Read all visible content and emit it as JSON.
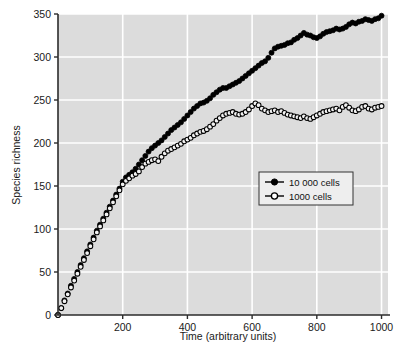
{
  "chart_data": {
    "type": "scatter",
    "title": "",
    "xlabel": "Time (arbitrary units)",
    "ylabel": "Species richness",
    "xlim": [
      0,
      1020
    ],
    "ylim": [
      0,
      350
    ],
    "xticks": [
      200,
      400,
      600,
      800,
      1000
    ],
    "yticks": [
      0,
      50,
      100,
      150,
      200,
      250,
      300,
      350
    ],
    "xtick_labels": [
      "200",
      "400",
      "600",
      "800",
      "1000"
    ],
    "ytick_labels": [
      "0",
      "50",
      "100",
      "150",
      "200",
      "250",
      "300",
      "350"
    ],
    "grid": true,
    "grid_color": "#ffffff",
    "plot_background": "#dcdcdc",
    "legend_position": "center-right",
    "marker_color": "#000000",
    "series": [
      {
        "name": "10 000 cells",
        "marker": "filled-circle",
        "x": [
          0,
          10,
          20,
          30,
          40,
          50,
          60,
          70,
          80,
          90,
          100,
          110,
          120,
          130,
          140,
          150,
          160,
          170,
          180,
          190,
          200,
          210,
          220,
          230,
          240,
          250,
          260,
          270,
          280,
          290,
          300,
          310,
          320,
          330,
          340,
          350,
          360,
          370,
          380,
          390,
          400,
          410,
          420,
          430,
          440,
          450,
          460,
          470,
          480,
          490,
          500,
          510,
          520,
          530,
          540,
          550,
          560,
          570,
          580,
          590,
          600,
          610,
          620,
          630,
          640,
          650,
          660,
          670,
          680,
          690,
          700,
          710,
          720,
          730,
          740,
          750,
          760,
          770,
          780,
          790,
          800,
          810,
          820,
          830,
          840,
          850,
          860,
          870,
          880,
          890,
          900,
          910,
          920,
          930,
          940,
          950,
          960,
          970,
          980,
          990,
          1000
        ],
        "y": [
          0,
          8,
          17,
          25,
          34,
          42,
          50,
          58,
          66,
          74,
          82,
          90,
          98,
          105,
          112,
          119,
          126,
          133,
          140,
          147,
          155,
          160,
          163,
          166,
          170,
          175,
          180,
          185,
          190,
          194,
          197,
          200,
          203,
          207,
          211,
          215,
          218,
          221,
          224,
          228,
          232,
          236,
          240,
          243,
          246,
          247,
          249,
          252,
          256,
          259,
          262,
          264,
          264,
          266,
          268,
          270,
          272,
          275,
          278,
          281,
          284,
          287,
          290,
          293,
          295,
          299,
          305,
          310,
          312,
          313,
          314,
          316,
          317,
          320,
          322,
          325,
          328,
          326,
          325,
          323,
          322,
          324,
          327,
          329,
          330,
          331,
          333,
          332,
          333,
          335,
          338,
          340,
          339,
          341,
          342,
          344,
          343,
          342,
          344,
          345,
          348
        ]
      },
      {
        "name": "1000 cells",
        "marker": "open-circle",
        "x": [
          0,
          10,
          20,
          30,
          40,
          50,
          60,
          70,
          80,
          90,
          100,
          110,
          120,
          130,
          140,
          150,
          160,
          170,
          180,
          190,
          200,
          210,
          220,
          230,
          240,
          250,
          260,
          270,
          280,
          290,
          300,
          310,
          320,
          330,
          340,
          350,
          360,
          370,
          380,
          390,
          400,
          410,
          420,
          430,
          440,
          450,
          460,
          470,
          480,
          490,
          500,
          510,
          520,
          530,
          540,
          550,
          560,
          570,
          580,
          590,
          600,
          610,
          620,
          630,
          640,
          650,
          660,
          670,
          680,
          690,
          700,
          710,
          720,
          730,
          740,
          750,
          760,
          770,
          780,
          790,
          800,
          810,
          820,
          830,
          840,
          850,
          860,
          870,
          880,
          890,
          900,
          910,
          920,
          930,
          940,
          950,
          960,
          970,
          980,
          990,
          1000
        ],
        "y": [
          0,
          8,
          16,
          24,
          32,
          40,
          48,
          56,
          64,
          72,
          80,
          88,
          96,
          103,
          110,
          117,
          124,
          131,
          138,
          145,
          152,
          156,
          159,
          162,
          164,
          167,
          172,
          176,
          178,
          180,
          181,
          179,
          184,
          188,
          191,
          193,
          195,
          197,
          199,
          202,
          204,
          206,
          209,
          211,
          213,
          214,
          216,
          219,
          222,
          226,
          229,
          232,
          234,
          235,
          236,
          234,
          233,
          234,
          236,
          239,
          243,
          246,
          244,
          240,
          238,
          236,
          237,
          238,
          236,
          237,
          235,
          233,
          232,
          231,
          230,
          229,
          231,
          229,
          228,
          230,
          232,
          234,
          236,
          237,
          238,
          239,
          240,
          238,
          242,
          244,
          241,
          238,
          237,
          239,
          242,
          243,
          240,
          239,
          241,
          242,
          243
        ]
      }
    ]
  },
  "legend": {
    "items": [
      {
        "label": "10 000 cells",
        "marker": "filled-circle"
      },
      {
        "label": "1000 cells",
        "marker": "open-circle"
      }
    ]
  },
  "axes": {
    "x_title": "Time (arbitrary units)",
    "y_title": "Species richness"
  }
}
